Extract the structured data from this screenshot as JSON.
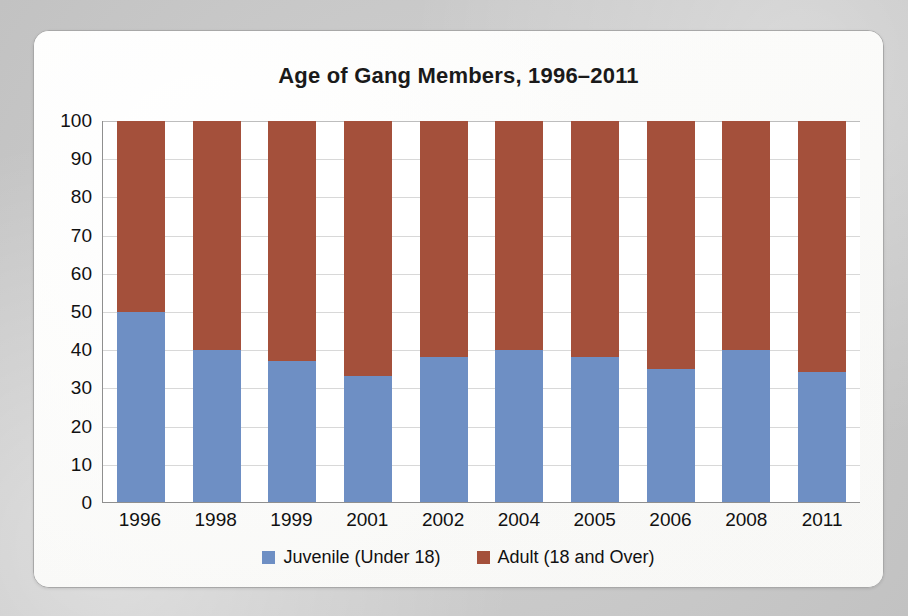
{
  "chart_data": {
    "type": "bar",
    "subtype": "stacked-percent-column",
    "title": "Age of Gang Members, 1996–2011",
    "xlabel": "",
    "ylabel": "Percent",
    "ylim": [
      0,
      100
    ],
    "ytick_step": 10,
    "ytick_labels": [
      "100",
      "90",
      "80",
      "70",
      "60",
      "50",
      "40",
      "30",
      "20",
      "10",
      "0"
    ],
    "ytick_values": [
      100,
      90,
      80,
      70,
      60,
      50,
      40,
      30,
      20,
      10,
      0
    ],
    "grid": true,
    "grid_axis": "y",
    "legend_position": "bottom-center",
    "categories": [
      "1996",
      "1998",
      "1999",
      "2001",
      "2002",
      "2004",
      "2005",
      "2006",
      "2008",
      "2011"
    ],
    "series": [
      {
        "name": "Juvenile (Under 18)",
        "color": "#6e8fc4",
        "values": [
          50,
          40,
          37,
          33,
          38,
          40,
          38,
          35,
          40,
          34
        ]
      },
      {
        "name": "Adult (18 and Over)",
        "color": "#a4503b",
        "values": [
          50,
          60,
          63,
          67,
          62,
          60,
          62,
          65,
          60,
          66
        ]
      }
    ]
  },
  "legend": {
    "items": [
      {
        "label": "Juvenile (Under 18)",
        "color": "#6e8fc4"
      },
      {
        "label": "Adult (18 and Over)",
        "color": "#a4503b"
      }
    ]
  },
  "colors": {
    "juvenile": "#6e8fc4",
    "adult": "#a4503b",
    "plot_background": "#ffffff",
    "card_background": "#fbfbfa",
    "page_background": "#c9c9c9",
    "gridline": "#d8d8d8",
    "axis": "#8f8f8f",
    "text": "#111111"
  }
}
